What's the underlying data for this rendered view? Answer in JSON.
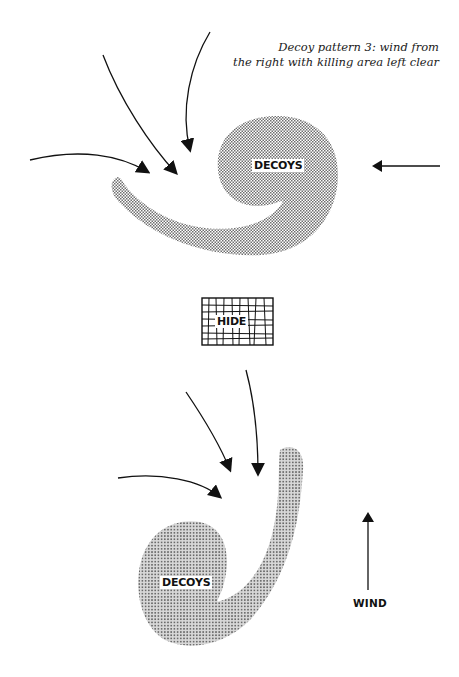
{
  "figure": {
    "caption_line1": "Decoy pattern 3: wind from",
    "caption_line2": "the right with killing area left clear",
    "top_group": {
      "decoy_label": "DECOYS",
      "wind_arrow_direction": "left"
    },
    "hide_label": "HIDE",
    "bottom_group": {
      "decoy_label": "DECOYS",
      "wind_label": "WIND",
      "wind_arrow_direction": "up"
    },
    "colors": {
      "ink": "#111111",
      "stipple": "#8a8a8a",
      "background": "#ffffff"
    },
    "icons": [
      "arrow-icon",
      "hide-grid-icon",
      "stipple-decoy-shape"
    ]
  }
}
